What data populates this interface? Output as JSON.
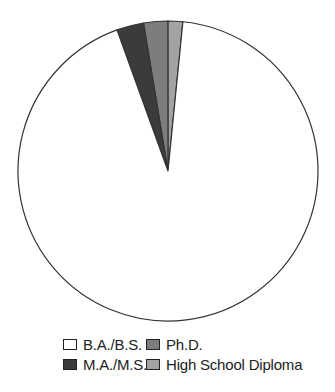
{
  "chart_data": {
    "type": "pie",
    "title": "",
    "start_angle_deg": 0,
    "direction": "counterclockwise-from-top-for-small-slices",
    "slices": [
      {
        "label": "High School Diploma",
        "value": 1.6,
        "color": "#a3a3a3"
      },
      {
        "label": "Ph.D.",
        "value": 2.6,
        "color": "#7d7d7d"
      },
      {
        "label": "M.A./M.S.",
        "value": 2.9,
        "color": "#3b3b3b"
      },
      {
        "label": "B.A./B.S.",
        "value": 92.9,
        "color": "#ffffff"
      }
    ],
    "legend": {
      "position": "bottom",
      "entries": [
        "B.A./B.S.",
        "Ph.D.",
        "M.A./M.S.",
        "High School Diploma"
      ]
    },
    "units": "percent (estimated from slice angles)"
  },
  "legend": {
    "items": [
      {
        "label": "B.A./B.S.",
        "color": "#ffffff"
      },
      {
        "label": "Ph.D.",
        "color": "#7d7d7d"
      },
      {
        "label": "M.A./M.S.",
        "color": "#3b3b3b"
      },
      {
        "label": "High School Diploma",
        "color": "#a3a3a3"
      }
    ]
  }
}
